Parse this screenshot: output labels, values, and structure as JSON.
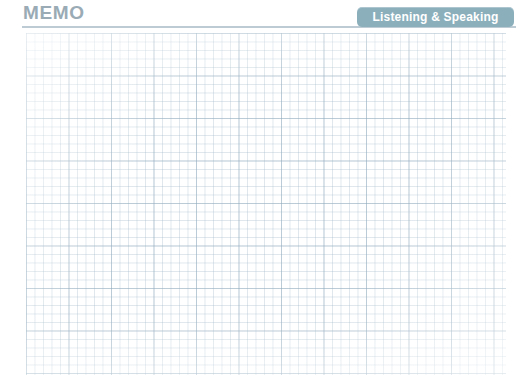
{
  "page": {
    "background_color": "#ffffff",
    "width": 528,
    "height": 387
  },
  "header": {
    "title": "MEMO",
    "title_color": "#9aabb5",
    "rule_color": "#b9c9d2",
    "badge": {
      "label": "Listening & Speaking",
      "background_color": "#8cafbc",
      "text_color": "#ffffff"
    }
  },
  "main": {
    "note_area": {
      "type": "graph-paper-grid",
      "cell_size_px": 8.5,
      "major_cell_size_px": 42.5,
      "line_color": "#96b0c2",
      "major_line_color": "#88a4b8",
      "background_color": "#ffffff",
      "content": ""
    }
  }
}
